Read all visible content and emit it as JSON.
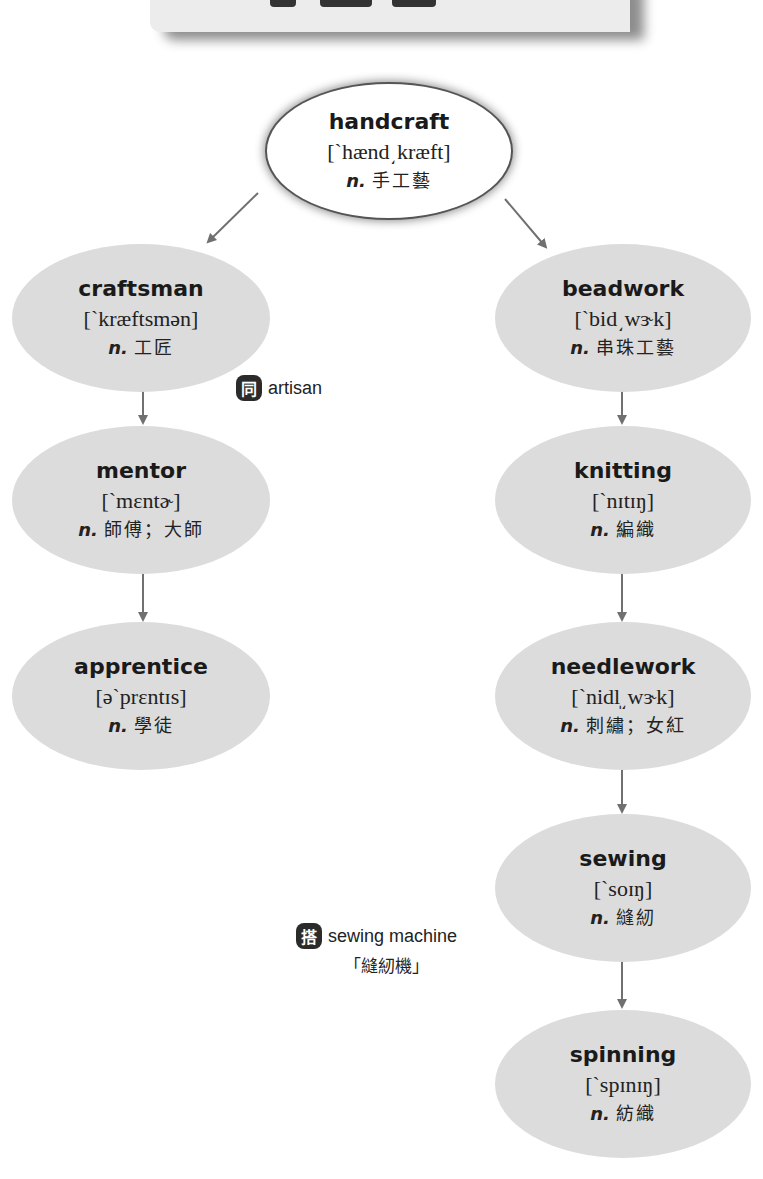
{
  "banner": {
    "background": "#ececec",
    "title_glyphs_cropped": true
  },
  "root": {
    "word": "handcraft",
    "phonetic": "[`hænd͵kræft]",
    "pos": "n.",
    "meaning": "手工藝"
  },
  "left_branch": [
    {
      "word": "craftsman",
      "phonetic": "[`kræftsmən]",
      "pos": "n.",
      "meaning": "工匠"
    },
    {
      "word": "mentor",
      "phonetic": "[`mɛntɚ]",
      "pos": "n.",
      "meaning": "師傅；大師"
    },
    {
      "word": "apprentice",
      "phonetic": "[ə`prɛntɪs]",
      "pos": "n.",
      "meaning": "學徒"
    }
  ],
  "right_branch": [
    {
      "word": "beadwork",
      "phonetic": "[`bid͵wɝk]",
      "pos": "n.",
      "meaning": "串珠工藝"
    },
    {
      "word": "knitting",
      "phonetic": "[`nɪtɪŋ]",
      "pos": "n.",
      "meaning": "編織"
    },
    {
      "word": "needlework",
      "phonetic": "[`nidl̩͵wɝk]",
      "pos": "n.",
      "meaning": "刺繡；女紅"
    },
    {
      "word": "sewing",
      "phonetic": "[`soɪŋ]",
      "pos": "n.",
      "meaning": "縫紉"
    },
    {
      "word": "spinning",
      "phonetic": "[`spɪnɪŋ]",
      "pos": "n.",
      "meaning": "紡織"
    }
  ],
  "notes": {
    "synonym": {
      "badge": "同",
      "text": "artisan"
    },
    "collocation": {
      "badge": "搭",
      "text": "sewing machine",
      "translation": "「縫紉機」"
    }
  },
  "colors": {
    "node_fill": "#dcdcdc",
    "root_fill": "#ffffff",
    "arrow": "#707070",
    "badge": "#2b2b2b",
    "text": "#1a1a1a"
  }
}
